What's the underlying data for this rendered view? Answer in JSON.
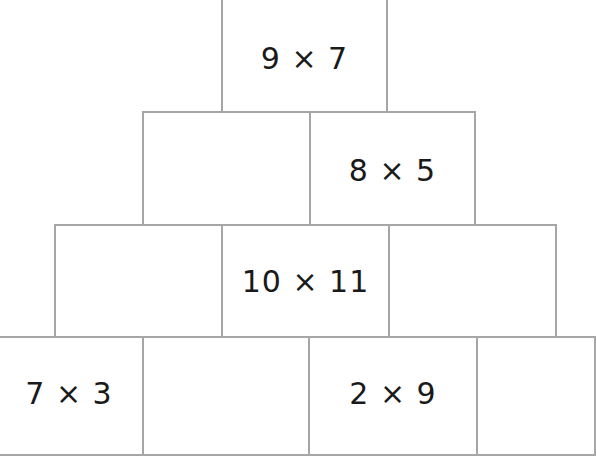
{
  "diagram": {
    "type": "multiplication-pyramid",
    "line_color": "#a6a6a6",
    "text_color": "#1a1a1a",
    "rows": [
      {
        "row": 1,
        "bricks": [
          {
            "label": "9 × 7"
          }
        ]
      },
      {
        "row": 2,
        "bricks": [
          {
            "label": ""
          },
          {
            "label": "8 × 5"
          }
        ]
      },
      {
        "row": 3,
        "bricks": [
          {
            "label": ""
          },
          {
            "label": "10 × 11"
          },
          {
            "label": ""
          }
        ]
      },
      {
        "row": 4,
        "bricks": [
          {
            "label": "7 × 3"
          },
          {
            "label": ""
          },
          {
            "label": "2 × 9"
          },
          {
            "label": ""
          }
        ]
      }
    ]
  }
}
